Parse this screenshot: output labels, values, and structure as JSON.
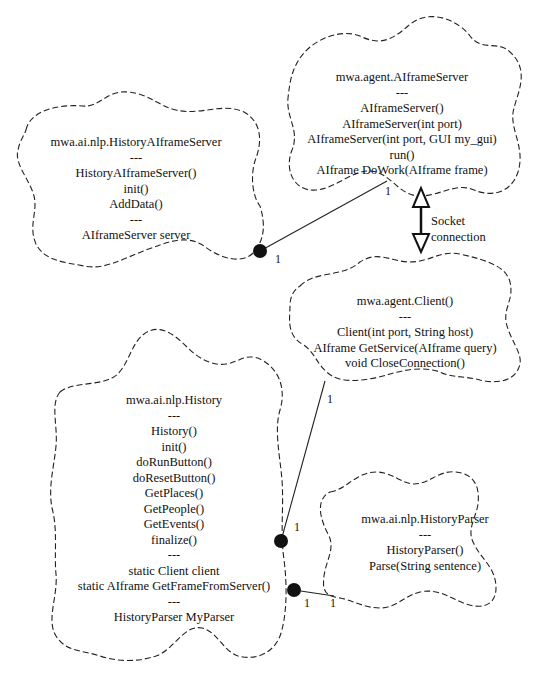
{
  "classes": {
    "aiframe_server": {
      "name": "mwa.agent.AIframeServer",
      "lines": [
        "---",
        "AIframeServer()",
        "AIframeServer(int port)",
        "AIframeServer(int port, GUI my_gui)",
        "run()",
        "AIframe DoWork(AIframe frame)"
      ]
    },
    "history_aiframe_server": {
      "name": "mwa.ai.nlp.HistoryAIframeServer",
      "lines": [
        "---",
        "HistoryAIframeServer()",
        "init()",
        "AddData()",
        "---",
        "AIframeServer server"
      ]
    },
    "client": {
      "name": "mwa.agent.Client()",
      "lines": [
        "---",
        "Client(int port, String host)",
        "AIframe GetService(AIframe query)",
        "void CloseConnection()"
      ]
    },
    "history": {
      "name": "mwa.ai.nlp.History",
      "lines": [
        "---",
        "History()",
        "init()",
        "doRunButton()",
        "doResetButton()",
        "GetPlaces()",
        "GetPeople()",
        "GetEvents()",
        "finalize()",
        "---",
        "static Client client",
        "static AIframe GetFrameFromServer()",
        "---",
        "HistoryParser MyParser"
      ]
    },
    "history_parser": {
      "name": "mwa.ai.nlp.HistoryParser",
      "lines": [
        "---",
        "HistoryParser()",
        "Parse(String sentence)"
      ]
    }
  },
  "socket_label": {
    "line1": "Socket",
    "line2": "connection"
  },
  "multiplicities": {
    "server_end": "1",
    "history_server_end": "1",
    "client_end": "1",
    "history_client_end": "1",
    "history_parser_end_a": "1",
    "history_parser_end_b": "1"
  }
}
